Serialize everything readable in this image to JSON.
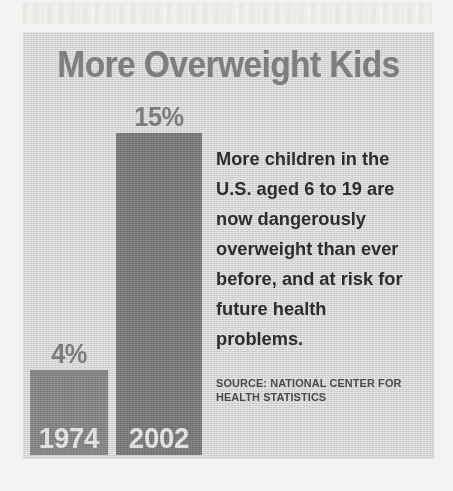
{
  "chart_data": {
    "type": "bar",
    "title": "More Overweight Kids",
    "categories": [
      "1974",
      "2002"
    ],
    "values": [
      4,
      15
    ],
    "value_labels": [
      "4%",
      "15%"
    ],
    "xlabel": "",
    "ylabel": "",
    "unit": "percent",
    "ylim": [
      0,
      15
    ],
    "grid": false,
    "legend": false,
    "series": [
      {
        "name": "Share of U.S. children aged 6 to 19 who are overweight",
        "values": [
          4,
          15
        ]
      }
    ],
    "annotation": "More children in the U.S. aged 6 to 19 are now dangerously overweight than ever before, and at risk for future health problems.",
    "source": "SOURCE: NATIONAL CENTER FOR HEALTH STATISTICS",
    "colors": {
      "panel_background": "#d6d6d4",
      "page_background": "#f3f3f1",
      "title_text": "#7e7e7e",
      "bar_1974": "#878787",
      "bar_2002": "#7b7b7b",
      "value_label_text": "#7c7c7c",
      "year_label_text": "#e9e9e7",
      "body_text": "#2d2d2d",
      "source_text": "#4a4a4a"
    }
  },
  "panel": {
    "title": "More Overweight Kids",
    "bars": [
      {
        "year": "1974",
        "value_label": "4%",
        "value": 4
      },
      {
        "year": "2002",
        "value_label": "15%",
        "value": 15
      }
    ],
    "caption": {
      "body": "More children in the U.S. aged 6 to 19 are now dangerously overweight than ever before, and at risk for future health problems.",
      "source": "SOURCE: NATIONAL CENTER FOR HEALTH STATISTICS"
    }
  }
}
